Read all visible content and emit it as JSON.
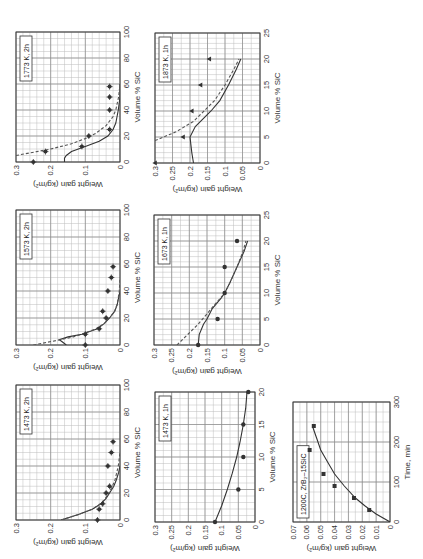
{
  "chart_data": [
    {
      "type": "scatter",
      "panel": "1773K-2h",
      "title": "1773 K, 2h",
      "xlabel": "Volume % SiC",
      "ylabel": "Weight gain (kg/m²)",
      "xlim": [
        0,
        100
      ],
      "ylim": [
        0,
        0.3
      ],
      "xticks": [
        0,
        20,
        40,
        60,
        80,
        100
      ],
      "yticks": [
        0,
        0.1,
        0.2,
        0.3
      ],
      "grid": true,
      "box": {
        "x": 397,
        "y": 16,
        "w": 130,
        "h": 104
      },
      "points": {
        "marker": "star",
        "x": [
          0,
          8,
          12,
          20,
          25,
          40,
          50,
          58
        ],
        "y": [
          0.25,
          0.215,
          0.11,
          0.09,
          0.03,
          0.03,
          0.03,
          0.03
        ]
      },
      "series": [
        {
          "name": "model-solid",
          "style": "solid",
          "x": [
            0,
            3,
            5,
            8,
            12,
            16,
            20,
            25,
            30,
            40,
            50,
            60
          ],
          "y": [
            0.16,
            0.16,
            0.155,
            0.14,
            0.1,
            0.06,
            0.035,
            0.02,
            0.012,
            0.005,
            0.0,
            0.0
          ]
        },
        {
          "name": "model-dashed",
          "style": "dashed",
          "x": [
            5,
            8,
            10,
            14,
            18,
            22,
            28,
            35,
            40,
            50,
            60
          ],
          "y": [
            0.3,
            0.24,
            0.2,
            0.14,
            0.1,
            0.07,
            0.04,
            0.02,
            0.012,
            0.004,
            0.0
          ]
        }
      ]
    },
    {
      "type": "scatter",
      "panel": "1873K-1h",
      "title": "1873 K, 1h",
      "xlabel": "Volume % SiC",
      "ylabel": "Weight gain (kg/m²)",
      "xlim": [
        0,
        25
      ],
      "ylim": [
        0,
        0.3
      ],
      "xticks": [
        0,
        5,
        10,
        15,
        20,
        25
      ],
      "yticks": [
        0,
        0.05,
        0.1,
        0.15,
        0.2,
        0.25,
        0.3
      ],
      "grid": true,
      "box": {
        "x": 396,
        "y": 155,
        "w": 130,
        "h": 105
      },
      "points": {
        "marker": "triangle",
        "x": [
          0,
          5,
          10,
          15,
          20
        ],
        "y": [
          0.3,
          0.22,
          0.195,
          0.17,
          0.145
        ]
      },
      "series": [
        {
          "name": "model-solid",
          "style": "solid",
          "x": [
            0,
            2,
            5,
            7,
            10,
            12,
            15,
            18,
            20
          ],
          "y": [
            0.19,
            0.195,
            0.2,
            0.185,
            0.14,
            0.115,
            0.09,
            0.068,
            0.055
          ]
        },
        {
          "name": "model-dashed",
          "style": "dashed",
          "x": [
            4.3,
            6,
            8,
            10,
            12,
            15,
            18,
            20
          ],
          "y": [
            0.3,
            0.24,
            0.19,
            0.16,
            0.13,
            0.1,
            0.075,
            0.06
          ]
        }
      ]
    },
    {
      "type": "scatter",
      "panel": "1573K-2h",
      "title": "1573 K, 2h",
      "xlabel": "Volume % SiC",
      "ylabel": "Weight gain (kg/m²)",
      "xlim": [
        0,
        100
      ],
      "ylim": [
        0,
        0.3
      ],
      "xticks": [
        0,
        20,
        40,
        60,
        80,
        100
      ],
      "yticks": [
        0,
        0.1,
        0.2,
        0.3
      ],
      "grid": true,
      "box": {
        "x": 214,
        "y": 16,
        "w": 135,
        "h": 104
      },
      "points": {
        "marker": "star",
        "x": [
          0,
          8,
          12,
          20,
          25,
          40,
          50,
          58
        ],
        "y": [
          0.1,
          0.1,
          0.06,
          0.04,
          0.05,
          0.035,
          0.025,
          0.02
        ]
      },
      "series": [
        {
          "name": "model-solid",
          "style": "solid",
          "x": [
            0,
            2,
            4,
            6,
            8,
            12,
            16,
            20,
            25,
            30,
            40
          ],
          "y": [
            0.155,
            0.165,
            0.175,
            0.15,
            0.11,
            0.065,
            0.045,
            0.03,
            0.015,
            0.008,
            0.0
          ]
        },
        {
          "name": "model-dashed",
          "style": "dashed",
          "x": [
            0,
            2,
            4,
            6,
            8,
            12,
            16,
            20,
            25,
            30,
            40,
            50
          ],
          "y": [
            0.25,
            0.21,
            0.17,
            0.135,
            0.11,
            0.07,
            0.045,
            0.03,
            0.016,
            0.008,
            0.002,
            0.0
          ]
        }
      ]
    },
    {
      "type": "scatter",
      "panel": "1673K-1h",
      "title": "1673 K, 1h",
      "xlabel": "Volume % SiC",
      "ylabel": "Weight gain (kg/m²)",
      "xlim": [
        0,
        25
      ],
      "ylim": [
        0,
        0.3
      ],
      "xticks": [
        0,
        5,
        10,
        15,
        20,
        25
      ],
      "yticks": [
        0,
        0.05,
        0.1,
        0.15,
        0.2,
        0.25,
        0.3
      ],
      "grid": true,
      "box": {
        "x": 214,
        "y": 154,
        "w": 130,
        "h": 106
      },
      "points": {
        "marker": "circle",
        "x": [
          0,
          5,
          10,
          15,
          20
        ],
        "y": [
          0.175,
          0.12,
          0.1,
          0.1,
          0.065
        ]
      },
      "series": [
        {
          "name": "model-solid",
          "style": "solid",
          "x": [
            0,
            2,
            4,
            5,
            7,
            9,
            10,
            12,
            15,
            18,
            20
          ],
          "y": [
            0.175,
            0.172,
            0.16,
            0.15,
            0.135,
            0.11,
            0.1,
            0.085,
            0.065,
            0.045,
            0.035
          ]
        },
        {
          "name": "model-dashed",
          "style": "dashed",
          "x": [
            0,
            2,
            4,
            6,
            8,
            10,
            12,
            15,
            18,
            20
          ],
          "y": [
            0.235,
            0.205,
            0.175,
            0.15,
            0.125,
            0.1,
            0.085,
            0.065,
            0.048,
            0.04
          ]
        }
      ]
    },
    {
      "type": "scatter",
      "panel": "1473K-2h",
      "title": "1473 K, 2h",
      "xlabel": "Volume % SiC",
      "ylabel": "Weight gain (kg/m²)",
      "xlim": [
        0,
        100
      ],
      "ylim": [
        0,
        0.3
      ],
      "xticks": [
        0,
        20,
        40,
        60,
        80,
        100
      ],
      "yticks": [
        0,
        0.1,
        0.2,
        0.3
      ],
      "grid": true,
      "box": {
        "x": 39,
        "y": 16,
        "w": 135,
        "h": 104
      },
      "points": {
        "marker": "star",
        "x": [
          0,
          8,
          12,
          20,
          25,
          40,
          50,
          58
        ],
        "y": [
          0.065,
          0.06,
          0.05,
          0.04,
          0.03,
          0.035,
          0.025,
          0.02
        ]
      },
      "series": [
        {
          "name": "model-solid",
          "style": "solid",
          "x": [
            0,
            4,
            8,
            12,
            16,
            20,
            25,
            30,
            35,
            40
          ],
          "y": [
            0.17,
            0.12,
            0.08,
            0.055,
            0.04,
            0.03,
            0.018,
            0.01,
            0.004,
            0.0
          ]
        },
        {
          "name": "model-dashed",
          "style": "dashed",
          "x": [
            0,
            4,
            8,
            12,
            16,
            20,
            25,
            30,
            40,
            50
          ],
          "y": [
            0.17,
            0.12,
            0.08,
            0.056,
            0.042,
            0.032,
            0.022,
            0.014,
            0.005,
            0.0
          ]
        }
      ]
    },
    {
      "type": "scatter",
      "panel": "1473K-1h",
      "title": "1473 K, 1h",
      "xlabel": "Volume % SiC",
      "ylabel": "Weight gain (kg/m²)",
      "xlim": [
        0,
        20
      ],
      "ylim": [
        0,
        0.3
      ],
      "xticks": [
        0,
        5,
        10,
        15,
        20
      ],
      "yticks": [
        0,
        0.05,
        0.1,
        0.15,
        0.2,
        0.25,
        0.3
      ],
      "grid": true,
      "box": {
        "x": 37,
        "y": 155,
        "w": 130,
        "h": 100
      },
      "points": {
        "marker": "circle",
        "x": [
          0,
          5,
          10,
          15,
          20
        ],
        "y": [
          0.12,
          0.05,
          0.035,
          0.035,
          0.02
        ]
      },
      "series": [
        {
          "name": "model-solid",
          "style": "solid",
          "x": [
            0,
            2.5,
            5,
            7.5,
            10,
            12.5,
            15,
            17.5,
            20
          ],
          "y": [
            0.12,
            0.1,
            0.083,
            0.068,
            0.055,
            0.044,
            0.035,
            0.028,
            0.024
          ]
        }
      ]
    },
    {
      "type": "scatter",
      "panel": "1200C-ZrB2-15SiC",
      "title": "1200C, ZrB₂–15SiC",
      "xlabel": "Time, min",
      "ylabel": "Weight gain (kg/m²)",
      "xlim": [
        0,
        300
      ],
      "ylim": [
        0,
        0.07
      ],
      "xticks": [
        0,
        100,
        200,
        300
      ],
      "yticks": [
        0,
        0.01,
        0.02,
        0.03,
        0.04,
        0.05,
        0.06,
        0.07
      ],
      "grid": true,
      "box": {
        "x": 37,
        "y": 293,
        "w": 120,
        "h": 97
      },
      "points": {
        "marker": "square",
        "x": [
          30,
          60,
          90,
          120,
          180,
          240
        ],
        "y": [
          0.015,
          0.026,
          0.04,
          0.048,
          0.058,
          0.055
        ]
      },
      "series": [
        {
          "name": "parabolic-fit",
          "style": "solid",
          "x": [
            0,
            20,
            40,
            60,
            90,
            120,
            150,
            180,
            210,
            240
          ],
          "y": [
            0.0,
            0.01,
            0.018,
            0.025,
            0.033,
            0.04,
            0.045,
            0.05,
            0.053,
            0.056
          ]
        }
      ]
    }
  ]
}
